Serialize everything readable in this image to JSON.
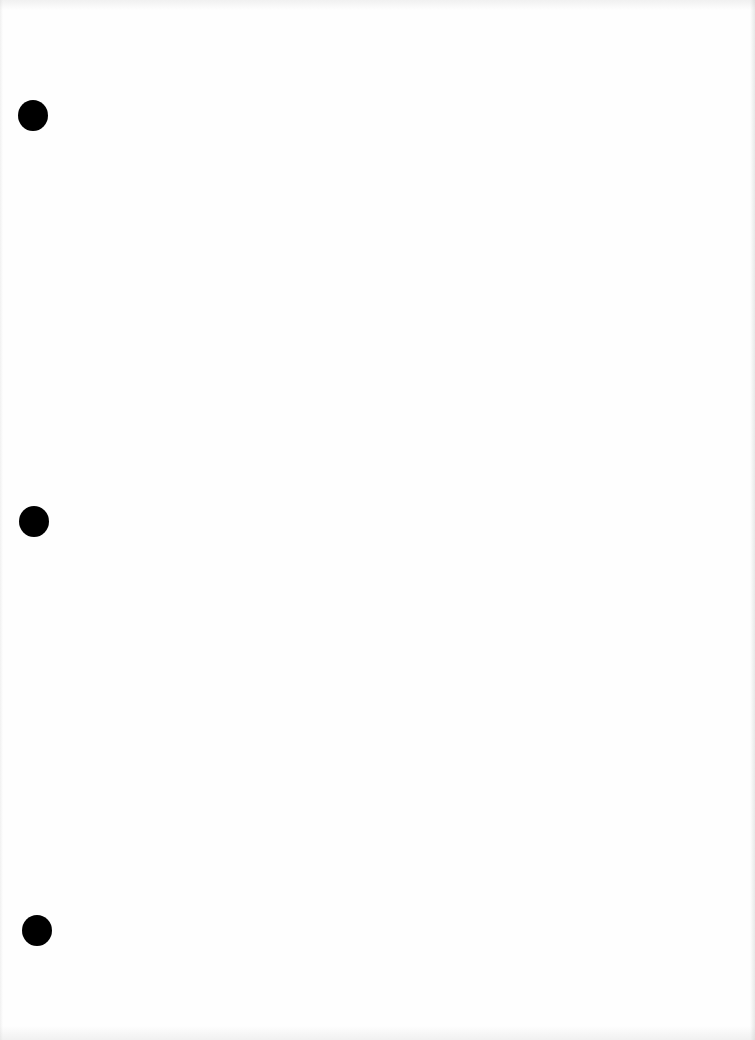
{
  "document": {
    "type": "blank scanned page",
    "background_color": "#fefefe",
    "text_content": ""
  },
  "punch_holes": [
    {
      "id": "top",
      "cx": 33,
      "cy": 115,
      "diameter": 30,
      "color": "#000000"
    },
    {
      "id": "middle",
      "cx": 34,
      "cy": 521,
      "diameter": 30,
      "color": "#000000"
    },
    {
      "id": "bottom",
      "cx": 37,
      "cy": 930,
      "diameter": 30,
      "color": "#000000"
    }
  ]
}
